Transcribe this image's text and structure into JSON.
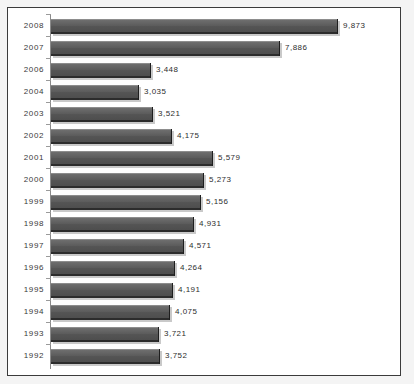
{
  "chart_data": {
    "type": "bar",
    "orientation": "horizontal",
    "title": "",
    "subtitle": "",
    "xlabel": "",
    "ylabel": "",
    "legend": [],
    "grid": false,
    "xlim": [
      0,
      9873
    ],
    "categories": [
      "2008",
      "2007",
      "2006",
      "2004",
      "2003",
      "2002",
      "2001",
      "2000",
      "1999",
      "1998",
      "1997",
      "1996",
      "1995",
      "1994",
      "1993",
      "1992"
    ],
    "values": [
      9873,
      7886,
      3448,
      3035,
      3521,
      4175,
      5579,
      5273,
      5156,
      4931,
      4571,
      4264,
      4191,
      4075,
      3721,
      3752
    ],
    "value_labels": [
      "9,873",
      "7,886",
      "3,448",
      "3,035",
      "3,521",
      "4,175",
      "5,579",
      "5,273",
      "5,156",
      "4,931",
      "4,571",
      "4,264",
      "4,191",
      "4,075",
      "3,721",
      "3,752"
    ],
    "rows": [
      {
        "category": "2008",
        "value": 9873,
        "label": "9,873"
      },
      {
        "category": "2007",
        "value": 7886,
        "label": "7,886"
      },
      {
        "category": "2006",
        "value": 3448,
        "label": "3,448"
      },
      {
        "category": "2004",
        "value": 3035,
        "label": "3,035"
      },
      {
        "category": "2003",
        "value": 3521,
        "label": "3,521"
      },
      {
        "category": "2002",
        "value": 4175,
        "label": "4,175"
      },
      {
        "category": "2001",
        "value": 5579,
        "label": "5,579"
      },
      {
        "category": "2000",
        "value": 5273,
        "label": "5,273"
      },
      {
        "category": "1999",
        "value": 5156,
        "label": "5,156"
      },
      {
        "category": "1998",
        "value": 4931,
        "label": "4,931"
      },
      {
        "category": "1997",
        "value": 4571,
        "label": "4,571"
      },
      {
        "category": "1996",
        "value": 4264,
        "label": "4,264"
      },
      {
        "category": "1995",
        "value": 4191,
        "label": "4,191"
      },
      {
        "category": "1994",
        "value": 4075,
        "label": "4,075"
      },
      {
        "category": "1993",
        "value": 3721,
        "label": "3,721"
      },
      {
        "category": "1992",
        "value": 3752,
        "label": "3,752"
      }
    ],
    "colors": {
      "bar_fill": "#5b5b5b",
      "bar_edge": "#2c2c2c",
      "bar_highlight": "#8d8d8d",
      "axis": "#8a8a8a",
      "frame": "#3b3b3b",
      "plot_background": "#ffffff",
      "page_background": "#f4f4f4",
      "text": "#2e2e2e"
    }
  },
  "layout": {
    "plot_left": 43,
    "plot_top": 8,
    "row_pitch": 22,
    "bar_height": 15,
    "px_per_unit": 0.0291,
    "label_gap": 5
  }
}
